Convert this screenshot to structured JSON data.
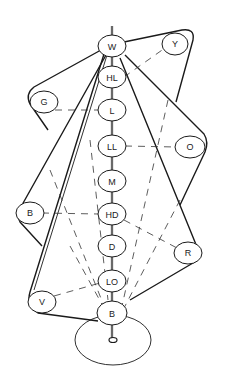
{
  "diagram": {
    "type": "color-solid-axis-diagram",
    "axis_nodes": [
      {
        "id": "W",
        "label": "W",
        "x": 112,
        "y": 46
      },
      {
        "id": "HL",
        "label": "HL",
        "x": 112,
        "y": 77
      },
      {
        "id": "L",
        "label": "L",
        "x": 112,
        "y": 110
      },
      {
        "id": "LL",
        "label": "LL",
        "x": 112,
        "y": 146
      },
      {
        "id": "M",
        "label": "M",
        "x": 112,
        "y": 181
      },
      {
        "id": "HD",
        "label": "HD",
        "x": 112,
        "y": 214
      },
      {
        "id": "D",
        "label": "D",
        "x": 112,
        "y": 246
      },
      {
        "id": "LD",
        "label": "LO",
        "x": 112,
        "y": 281
      },
      {
        "id": "Bk",
        "label": "B",
        "x": 112,
        "y": 313
      }
    ],
    "outer_nodes": [
      {
        "id": "Y",
        "label": "Y",
        "x": 175,
        "y": 44
      },
      {
        "id": "G",
        "label": "G",
        "x": 44,
        "y": 102
      },
      {
        "id": "O",
        "label": "O",
        "x": 190,
        "y": 147
      },
      {
        "id": "Bl",
        "label": "B",
        "x": 30,
        "y": 213
      },
      {
        "id": "R",
        "label": "R",
        "x": 188,
        "y": 253
      },
      {
        "id": "V",
        "label": "V",
        "x": 42,
        "y": 302
      }
    ],
    "base": {
      "label": "",
      "x": 113,
      "y": 340
    },
    "dashed_links": [
      [
        "HL",
        "Y"
      ],
      [
        "G",
        "L"
      ],
      [
        "LL",
        "O"
      ],
      [
        "Bl",
        "HD"
      ],
      [
        "HD",
        "R"
      ],
      [
        "V",
        "LD"
      ]
    ]
  }
}
